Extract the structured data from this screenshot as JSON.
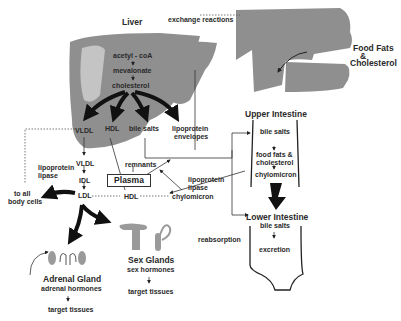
{
  "organs": {
    "liver": "Liver",
    "upper_intestine": "Upper Intestine",
    "lower_intestine": "Lower Intestine",
    "adrenal_gland": "Adrenal Gland",
    "sex_glands": "Sex Glands",
    "plasma": "Plasma",
    "food_fats_1": "Food Fats",
    "food_fats_2": "&",
    "food_fats_3": "Cholesterol"
  },
  "liver_pathway": [
    "acetyl - coA",
    "mevalonate",
    "cholesterol"
  ],
  "liver_outputs": [
    "VLDL",
    "HDL",
    "bile salts",
    "lipoprotein",
    "envelopes"
  ],
  "plasma_items": {
    "vldl": "VLDL",
    "idl": "IDL",
    "ldl": "LDL",
    "hdl": "HDL",
    "remnants": "remnants",
    "chylomicron": "chylomicron",
    "lipase_left_1": "lipoprotein",
    "lipase_left_2": "lipase",
    "lipase_right_1": "lipoprotein",
    "lipase_right_2": "lipase"
  },
  "upper_intestine_items": [
    "bile salts",
    "food fats &",
    "cholesterol",
    "chylomicron"
  ],
  "lower_intestine_items": [
    "bile salts",
    "excretion"
  ],
  "misc": {
    "exchange": "exchange reactions",
    "to_all_1": "to all",
    "to_all_2": "body cells",
    "reabsorption": "reabsorption",
    "adrenal_hormones": "adrenal hormones",
    "sex_hormones": "sex hormones",
    "target_tissues_1": "target tissues",
    "target_tissues_2": "target tissues"
  },
  "colors": {
    "organ_gray": "#8f8f8f",
    "organ_light": "#c4c4c4",
    "line": "#222222"
  }
}
